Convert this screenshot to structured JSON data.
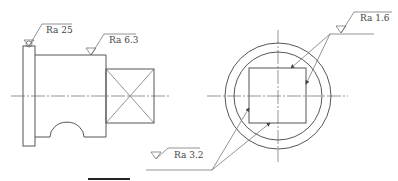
{
  "views": {
    "side_view": {
      "description": "Shaft with flange, square end, and semicircular notch",
      "annotations": [
        {
          "id": "flange-face",
          "label": "Ra 25"
        },
        {
          "id": "shaft-surface",
          "label": "Ra 6.3"
        }
      ]
    },
    "end_view": {
      "description": "Circular end view with inscribed square",
      "annotations": [
        {
          "id": "square-top-right",
          "label": "Ra 1.6"
        },
        {
          "id": "square-bottom-left",
          "label": "Ra 3.2"
        }
      ]
    }
  }
}
